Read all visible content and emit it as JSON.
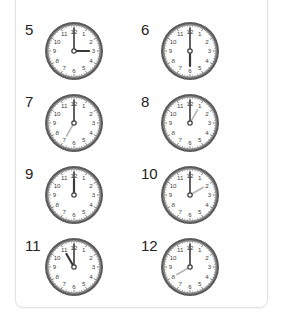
{
  "worksheet": {
    "items": [
      {
        "number": "5",
        "hour": 3,
        "minute": 0
      },
      {
        "number": "6",
        "hour": 6,
        "minute": 0
      },
      {
        "number": "7",
        "hour": 7,
        "minute": 0
      },
      {
        "number": "8",
        "hour": 1,
        "minute": 0
      },
      {
        "number": "9",
        "hour": 12,
        "minute": 0
      },
      {
        "number": "10",
        "hour": 2,
        "minute": 0
      },
      {
        "number": "11",
        "hour": 11,
        "minute": 0
      },
      {
        "number": "12",
        "hour": 8,
        "minute": 0
      }
    ],
    "clock_face_numerals": [
      "12",
      "1",
      "2",
      "3",
      "4",
      "5",
      "6",
      "7",
      "8",
      "9",
      "10",
      "11"
    ],
    "colors": {
      "rim": "#5a5a5a",
      "rim_inner": "#8a8a8a",
      "face": "#ffffff",
      "numeral": "#444444",
      "hand_dark": "#3a3a3a",
      "hand_light": "#b5b5b5"
    }
  }
}
